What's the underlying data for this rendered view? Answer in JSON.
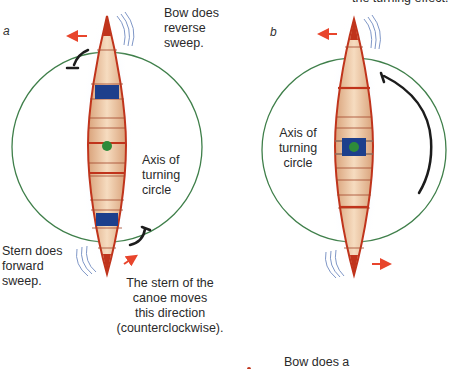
{
  "panels": [
    {
      "id": "a",
      "letter": "a",
      "labels": {
        "bow": [
          "Bow does",
          "reverse",
          "sweep."
        ],
        "axis": [
          "Axis of",
          "turning",
          "circle"
        ],
        "stern": [
          "Stern does",
          "forward",
          "sweep."
        ],
        "stern_motion": [
          "The stern of the",
          "canoe moves",
          "this direction",
          "(counterclockwise)."
        ]
      }
    },
    {
      "id": "b",
      "letter": "b",
      "labels": {
        "top_caption": "the turning effect.",
        "axis": [
          "Axis of",
          "turning",
          "circle"
        ]
      }
    }
  ],
  "footer": {
    "partial_caption": "Bow does a"
  },
  "colors": {
    "circle": "#3f7f4a",
    "hull_outline": "#c0341c",
    "hull_fill": "#eec9a4",
    "seat": "#1d3f8c",
    "pivot": "#2e8b3a",
    "arrow": "#e8452c",
    "ripple": "#7f97c7",
    "paddle": "#1c1c1c"
  }
}
